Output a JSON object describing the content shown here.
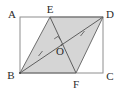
{
  "figure": {
    "kind": "geometry-diagram",
    "canvas": {
      "width": 118,
      "height": 91
    },
    "colors": {
      "background": "#ffffff",
      "shaded_fill": "#d5d5d5",
      "stroke": "#6e6e6e",
      "rect_stroke": "#8a8a8a",
      "label_text": "#2b2b2b",
      "tick": "#6e6e6e"
    },
    "points": [
      {
        "id": "A",
        "label": "A",
        "x": 20,
        "y": 17,
        "label_x": 12,
        "label_y": 14
      },
      {
        "id": "E",
        "label": "E",
        "x": 50,
        "y": 17,
        "label_x": 50,
        "label_y": 9
      },
      {
        "id": "D",
        "label": "D",
        "x": 103,
        "y": 17,
        "label_x": 110,
        "label_y": 14
      },
      {
        "id": "B",
        "label": "B",
        "x": 20,
        "y": 73,
        "label_x": 11,
        "label_y": 75
      },
      {
        "id": "F",
        "label": "F",
        "x": 76,
        "y": 73,
        "label_x": 76,
        "label_y": 84
      },
      {
        "id": "C",
        "label": "C",
        "x": 103,
        "y": 73,
        "label_x": 110,
        "label_y": 76
      },
      {
        "id": "O",
        "label": "O",
        "x": 61.5,
        "y": 45,
        "label_x": 60,
        "label_y": 51
      }
    ],
    "rectangle": {
      "id": "ABCD",
      "vertices": [
        "A",
        "D",
        "C",
        "B"
      ]
    },
    "shaded_polygon": {
      "id": "BEDF",
      "vertices": [
        "B",
        "E",
        "D",
        "F"
      ]
    },
    "segments": [
      {
        "id": "AD",
        "from": "A",
        "to": "D",
        "style": "rect-edge"
      },
      {
        "id": "DC",
        "from": "D",
        "to": "C",
        "style": "rect-edge"
      },
      {
        "id": "CB",
        "from": "C",
        "to": "B",
        "style": "rect-edge"
      },
      {
        "id": "BA",
        "from": "B",
        "to": "A",
        "style": "rect-edge"
      },
      {
        "id": "BE",
        "from": "B",
        "to": "E",
        "style": "solid"
      },
      {
        "id": "ED",
        "from": "E",
        "to": "D",
        "style": "solid"
      },
      {
        "id": "DF",
        "from": "D",
        "to": "F",
        "style": "solid"
      },
      {
        "id": "FB",
        "from": "F",
        "to": "B",
        "style": "solid"
      },
      {
        "id": "BD",
        "from": "B",
        "to": "D",
        "style": "diagonal"
      },
      {
        "id": "EF",
        "from": "E",
        "to": "F",
        "style": "diagonal"
      }
    ],
    "tick_marks": [
      {
        "id": "tick-BO",
        "on_segment": "BO",
        "x": 40.5,
        "y": 53.5
      },
      {
        "id": "tick-OD",
        "on_segment": "OD",
        "x": 82.5,
        "y": 33.5
      }
    ],
    "right_angle_mark": {
      "id": "right-angle-at-O",
      "at": "O",
      "x": 57.5,
      "y": 38.5,
      "size": 5
    }
  }
}
